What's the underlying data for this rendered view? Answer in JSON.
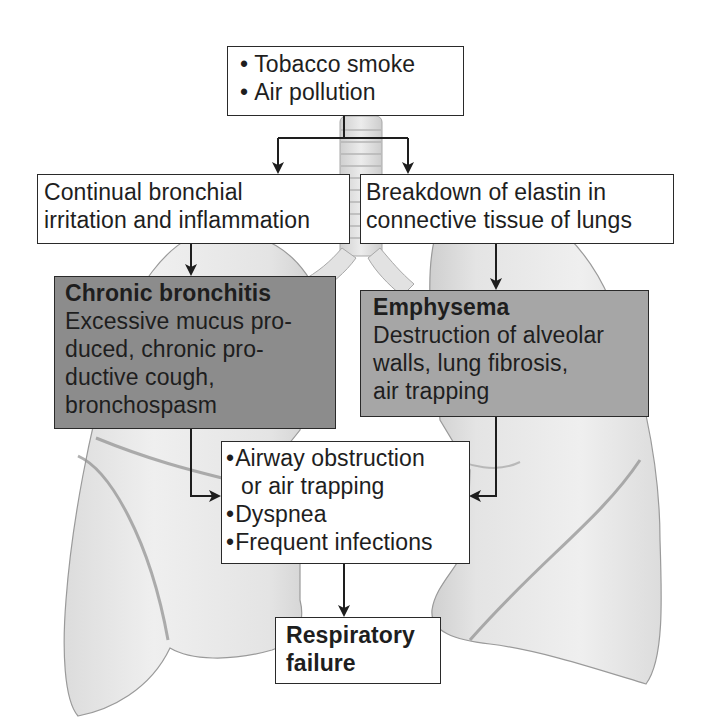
{
  "diagram": {
    "background_illustration": "lungs-and-trachea",
    "nodes": {
      "causes": {
        "items": [
          "Tobacco smoke",
          "Air pollution"
        ]
      },
      "bronchial_irritation": {
        "lines": [
          "Continual bronchial",
          "irritation and inflammation"
        ]
      },
      "elastin_breakdown": {
        "lines": [
          "Breakdown of elastin in",
          "connective tissue of lungs"
        ]
      },
      "chronic_bronchitis": {
        "title": "Chronic bronchitis",
        "lines": [
          "Excessive mucus pro-",
          "duced, chronic pro-",
          "ductive cough,",
          "bronchospasm"
        ]
      },
      "emphysema": {
        "title": "Emphysema",
        "lines": [
          "Destruction of alveolar",
          "walls, lung fibrosis,",
          "air trapping"
        ]
      },
      "common_effects": {
        "items": [
          {
            "text": "Airway obstruction",
            "continuation": "or air trapping"
          },
          {
            "text": "Dyspnea"
          },
          {
            "text": "Frequent infections"
          }
        ]
      },
      "outcome": {
        "lines": [
          "Respiratory",
          "failure"
        ]
      }
    },
    "edges": [
      {
        "from": "causes",
        "to": "bronchial_irritation"
      },
      {
        "from": "causes",
        "to": "elastin_breakdown"
      },
      {
        "from": "bronchial_irritation",
        "to": "chronic_bronchitis"
      },
      {
        "from": "elastin_breakdown",
        "to": "emphysema"
      },
      {
        "from": "chronic_bronchitis",
        "to": "common_effects"
      },
      {
        "from": "emphysema",
        "to": "common_effects"
      },
      {
        "from": "common_effects",
        "to": "outcome"
      }
    ],
    "colors": {
      "box_white": "#ffffff",
      "box_dark": "#8c8c8c",
      "box_mid": "#a6a6a6",
      "stroke": "#1e1e1e",
      "lung_fill": "#e6e6e6",
      "lung_edge": "#9a9a9a"
    }
  }
}
